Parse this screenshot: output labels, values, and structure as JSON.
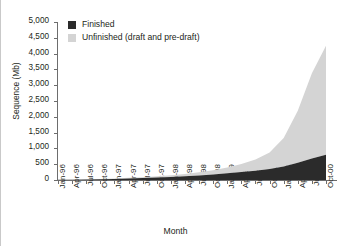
{
  "chart_data": {
    "type": "area",
    "stacked": true,
    "title": "",
    "xlabel": "Month",
    "ylabel": "Sequence (Mb)",
    "ylim": [
      0,
      5000
    ],
    "ytick_step": 500,
    "grid": false,
    "legend_position": "top-left-inside",
    "ytick_labels": [
      "0",
      "500",
      "1,000",
      "1,500",
      "2,000",
      "2,500",
      "3,000",
      "3,500",
      "4,000",
      "4,500",
      "5,000"
    ],
    "ytick_values": [
      0,
      500,
      1000,
      1500,
      2000,
      2500,
      3000,
      3500,
      4000,
      4500,
      5000
    ],
    "categories": [
      "Jan-96",
      "Apr-96",
      "Jul-96",
      "Oct-96",
      "Jan-97",
      "Apr-97",
      "Jul-97",
      "Oct-97",
      "Jan-98",
      "Apr-98",
      "Jul-98",
      "Oct-98",
      "Jan-99",
      "Apr-99",
      "Jul-99",
      "Oct-99",
      "Jan-00",
      "Apr-00",
      "Jul-00",
      "Oct-00"
    ],
    "series": [
      {
        "name": "Finished",
        "color": "#2b2b2b",
        "values": [
          5,
          10,
          16,
          24,
          34,
          46,
          60,
          76,
          95,
          118,
          145,
          175,
          210,
          250,
          295,
          350,
          430,
          545,
          680,
          800
        ]
      },
      {
        "name": "Unfinished (draft and pre-draft)",
        "color": "#d4d4d4",
        "values": [
          2,
          4,
          7,
          11,
          16,
          22,
          30,
          40,
          55,
          75,
          100,
          135,
          185,
          255,
          355,
          520,
          900,
          1650,
          2700,
          3450
        ]
      }
    ],
    "totals": [
      7,
      14,
      23,
      35,
      50,
      68,
      90,
      116,
      150,
      193,
      245,
      310,
      395,
      505,
      650,
      870,
      1330,
      2195,
      3380,
      4250
    ]
  },
  "legend": {
    "entries": [
      {
        "label": "Finished",
        "swatch_name": "legend-swatch-finished"
      },
      {
        "label": "Unfinished (draft and pre-draft)",
        "swatch_name": "legend-swatch-unfinished"
      }
    ]
  },
  "colors": {
    "finished": "#2b2b2b",
    "unfinished": "#d4d4d4",
    "axis": "#6d6d6d",
    "text": "#231f20",
    "frame": "#c9c9c9",
    "background": "#ffffff"
  }
}
